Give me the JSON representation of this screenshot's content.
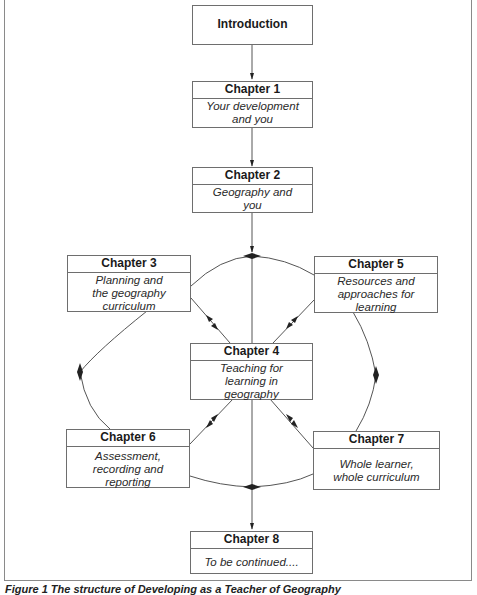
{
  "diagram": {
    "intro": {
      "title": "Introduction"
    },
    "chapters": [
      {
        "number": "Chapter 1",
        "title": "Your development and you"
      },
      {
        "number": "Chapter 2",
        "title": "Geography and you"
      },
      {
        "number": "Chapter 3",
        "title": "Planning and the geography curriculum"
      },
      {
        "number": "Chapter 4",
        "title": "Teaching for learning in geography"
      },
      {
        "number": "Chapter 5",
        "title": "Resources and approaches for learning"
      },
      {
        "number": "Chapter 6",
        "title": "Assessment, recording and reporting"
      },
      {
        "number": "Chapter 7",
        "title": "Whole learner, whole curriculum"
      },
      {
        "number": "Chapter 8",
        "title": "To be continued...."
      }
    ],
    "caption": "Figure 1  The structure of Developing as a Teacher of Geography",
    "colors": {
      "line": "#555555",
      "border": "#6e6e6e",
      "text": "#1a1a1a"
    }
  }
}
